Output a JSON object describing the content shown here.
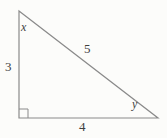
{
  "figure": {
    "type": "right-triangle-diagram",
    "labels": {
      "angle_top": "x",
      "angle_bottom_right": "y",
      "side_left": "3",
      "side_bottom": "4",
      "side_hypotenuse": "5"
    },
    "colors": {
      "line": "#8a8a8a",
      "text": "#3f3f3f",
      "background": "#fcfcfa"
    }
  }
}
